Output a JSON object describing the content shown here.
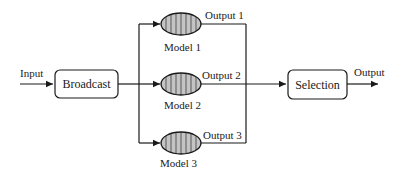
{
  "diagram": {
    "input_label": "Input",
    "broadcast_label": "Broadcast",
    "selection_label": "Selection",
    "output_label": "Output",
    "models": [
      {
        "label": "Model 1",
        "output": "Output 1"
      },
      {
        "label": "Model 2",
        "output": "Output 2"
      },
      {
        "label": "Model 3",
        "output": "Output 3"
      }
    ],
    "colors": {
      "stroke": "#1a1a1a",
      "model_fill": "#b8b8b8",
      "model_stripe": "#8a8a8a"
    }
  }
}
